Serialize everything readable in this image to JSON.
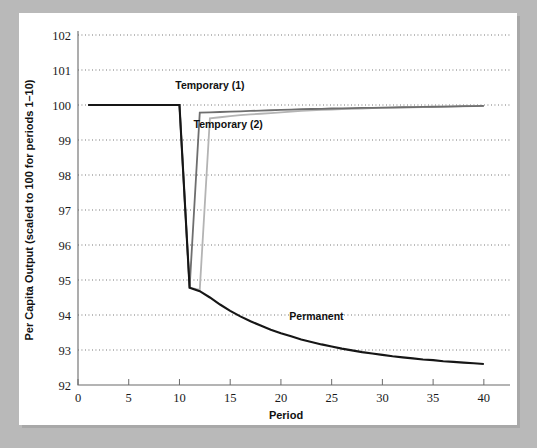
{
  "figure": {
    "background_color": "#b9b9b9",
    "panel_color": "#ffffff"
  },
  "chart_data": {
    "type": "line",
    "title": "",
    "xlabel": "Period",
    "ylabel": "Per Capita Output (scaled to 100 for periods 1–10)",
    "xlim": [
      0,
      41
    ],
    "ylim": [
      92,
      102
    ],
    "xticks": [
      0,
      5,
      10,
      15,
      20,
      25,
      30,
      35,
      40
    ],
    "xtick_labels": [
      "0",
      "5",
      "10",
      "15",
      "20",
      "25",
      "30",
      "35",
      "40"
    ],
    "yticks": [
      92,
      93,
      94,
      95,
      96,
      97,
      98,
      99,
      100,
      101,
      102
    ],
    "ytick_labels": [
      "92",
      "93",
      "94",
      "95",
      "96",
      "97",
      "98",
      "99",
      "100",
      "101",
      "102"
    ],
    "grid": "horizontal-dotted",
    "legend_position": "inline-annotations",
    "series": [
      {
        "name": "Permanent",
        "color": "#161616",
        "width": 2.1,
        "label_x": 23.5,
        "label_y": 93.85,
        "x": [
          1,
          2,
          3,
          4,
          5,
          6,
          7,
          8,
          9,
          10,
          11,
          12,
          13,
          14,
          15,
          16,
          17,
          18,
          19,
          20,
          21,
          22,
          23,
          24,
          25,
          26,
          27,
          28,
          29,
          30,
          31,
          32,
          33,
          34,
          35,
          36,
          37,
          38,
          39,
          40
        ],
        "y": [
          100,
          100,
          100,
          100,
          100,
          100,
          100,
          100,
          100,
          100,
          94.78,
          94.68,
          94.5,
          94.3,
          94.12,
          93.96,
          93.82,
          93.7,
          93.58,
          93.48,
          93.39,
          93.3,
          93.23,
          93.16,
          93.1,
          93.04,
          92.99,
          92.94,
          92.9,
          92.86,
          92.82,
          92.79,
          92.76,
          92.73,
          92.71,
          92.68,
          92.66,
          92.64,
          92.62,
          92.6
        ]
      },
      {
        "name": "Temporary (1)",
        "color": "#6e6e6e",
        "width": 1.8,
        "label_x": 13.0,
        "label_y": 100.45,
        "x": [
          1,
          2,
          3,
          4,
          5,
          6,
          7,
          8,
          9,
          10,
          11,
          12,
          13,
          14,
          15,
          16,
          17,
          18,
          19,
          20,
          21,
          22,
          23,
          24,
          25,
          26,
          27,
          28,
          29,
          30,
          31,
          32,
          33,
          34,
          35,
          36,
          37,
          38,
          39,
          40
        ],
        "y": [
          100,
          100,
          100,
          100,
          100,
          100,
          100,
          100,
          100,
          100,
          94.78,
          99.78,
          99.79,
          99.8,
          99.81,
          99.82,
          99.83,
          99.84,
          99.85,
          99.86,
          99.87,
          99.88,
          99.885,
          99.89,
          99.9,
          99.905,
          99.91,
          99.915,
          99.92,
          99.925,
          99.93,
          99.935,
          99.94,
          99.945,
          99.95,
          99.955,
          99.96,
          99.965,
          99.97,
          99.975
        ]
      },
      {
        "name": "Temporary (2)",
        "color": "#b4b4b4",
        "width": 1.8,
        "label_x": 14.8,
        "label_y": 99.35,
        "x": [
          1,
          2,
          3,
          4,
          5,
          6,
          7,
          8,
          9,
          10,
          11,
          12,
          13,
          14,
          15,
          16,
          17,
          18,
          19,
          20,
          21,
          22,
          23,
          24,
          25,
          26,
          27,
          28,
          29,
          30,
          31,
          32,
          33,
          34,
          35,
          36,
          37,
          38,
          39,
          40
        ],
        "y": [
          100,
          100,
          100,
          100,
          100,
          100,
          100,
          100,
          100,
          100,
          94.78,
          94.72,
          99.62,
          99.65,
          99.68,
          99.71,
          99.73,
          99.75,
          99.77,
          99.79,
          99.81,
          99.83,
          99.845,
          99.86,
          99.87,
          99.88,
          99.89,
          99.9,
          99.91,
          99.915,
          99.92,
          99.93,
          99.935,
          99.94,
          99.945,
          99.95,
          99.955,
          99.96,
          99.965,
          99.97
        ]
      }
    ]
  }
}
